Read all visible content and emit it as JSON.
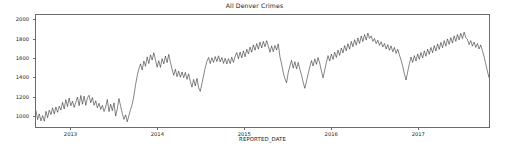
{
  "chart_data": {
    "type": "line",
    "title": "All Denver Crimes",
    "xlabel": "REPORTED_DATE",
    "ylabel": "",
    "grid": false,
    "legend": false,
    "line_color": "#1f1f1f",
    "axis_color": "#6b6b6b",
    "background": "#ffffff",
    "xlim": [
      "2012-08-05",
      "2017-10-29"
    ],
    "ylim": [
      880,
      2060
    ],
    "ytick_values": [
      1000,
      1200,
      1400,
      1600,
      1800,
      2000
    ],
    "ytick_labels": [
      "1000",
      "1200",
      "1400",
      "1600",
      "1800",
      "2000"
    ],
    "xtick_values": [
      "2013-01-01",
      "2014-01-01",
      "2015-01-01",
      "2016-01-01",
      "2017-01-01"
    ],
    "xtick_labels": [
      "2013",
      "2014",
      "2015",
      "2016",
      "2017"
    ],
    "series": [
      {
        "name": "All Denver Crimes",
        "x_start": "2012-08-05",
        "x_step_days": 7,
        "values": [
          1050,
          958,
          1018,
          944,
          1000,
          940,
          1045,
          978,
          1058,
          1012,
          1082,
          1016,
          1092,
          1035,
          1100,
          1058,
          1140,
          1070,
          1168,
          1096,
          1185,
          1104,
          1152,
          1086,
          1140,
          1196,
          1104,
          1212,
          1120,
          1205,
          1108,
          1188,
          1214,
          1136,
          1190,
          1108,
          1156,
          1082,
          1130,
          1064,
          1108,
          1044,
          1090,
          1170,
          1042,
          1120,
          1052,
          1134,
          995,
          1072,
          1180,
          1098,
          1022,
          960,
          1008,
          935,
          1002,
          1064,
          1120,
          1210,
          1325,
          1420,
          1492,
          1545,
          1480,
          1575,
          1520,
          1618,
          1548,
          1640,
          1585,
          1662,
          1588,
          1510,
          1578,
          1508,
          1600,
          1545,
          1628,
          1558,
          1645,
          1560,
          1490,
          1425,
          1488,
          1410,
          1468,
          1405,
          1460,
          1398,
          1455,
          1382,
          1440,
          1360,
          1300,
          1382,
          1312,
          1392,
          1292,
          1255,
          1340,
          1420,
          1505,
          1572,
          1612,
          1548,
          1610,
          1560,
          1622,
          1570,
          1630,
          1566,
          1612,
          1550,
          1605,
          1545,
          1600,
          1548,
          1615,
          1560,
          1625,
          1665,
          1598,
          1670,
          1608,
          1682,
          1620,
          1700,
          1650,
          1722,
          1668,
          1745,
          1688,
          1760,
          1700,
          1775,
          1712,
          1782,
          1725,
          1790,
          1730,
          1668,
          1735,
          1672,
          1740,
          1690,
          1755,
          1620,
          1545,
          1455,
          1390,
          1345,
          1452,
          1520,
          1582,
          1500,
          1568,
          1492,
          1560,
          1488,
          1430,
          1352,
          1288,
          1360,
          1440,
          1512,
          1580,
          1522,
          1598,
          1540,
          1612,
          1550,
          1470,
          1398,
          1480,
          1560,
          1632,
          1575,
          1648,
          1592,
          1668,
          1612,
          1690,
          1635,
          1712,
          1660,
          1738,
          1682,
          1758,
          1700,
          1782,
          1725,
          1800,
          1742,
          1818,
          1760,
          1838,
          1780,
          1855,
          1795,
          1870,
          1812,
          1840,
          1782,
          1812,
          1758,
          1795,
          1740,
          1778,
          1722,
          1760,
          1702,
          1748,
          1688,
          1735,
          1672,
          1718,
          1655,
          1700,
          1640,
          1585,
          1520,
          1442,
          1375,
          1462,
          1545,
          1618,
          1560,
          1632,
          1575,
          1650,
          1592,
          1665,
          1608,
          1682,
          1625,
          1700,
          1645,
          1718,
          1662,
          1738,
          1680,
          1755,
          1698,
          1772,
          1715,
          1790,
          1732,
          1808,
          1750,
          1822,
          1765,
          1840,
          1782,
          1855,
          1798,
          1868,
          1812,
          1880,
          1822,
          1805,
          1748,
          1790,
          1732,
          1775,
          1718,
          1760,
          1702,
          1745,
          1688,
          1625,
          1548,
          1470,
          1402,
          1488,
          1568,
          1642,
          1585,
          1658,
          1600,
          1672,
          1615,
          1690,
          1632,
          1708,
          1650,
          1725,
          1668,
          1745,
          1688,
          1762,
          1705,
          1780,
          1722,
          1798,
          1740,
          1815,
          1758,
          1832,
          1775,
          1850,
          1792,
          1865,
          1808,
          1880,
          1822,
          1895,
          1838,
          1912,
          1855,
          1930,
          1872,
          1948,
          1890,
          1962,
          1905,
          1975,
          1918,
          1990,
          1932,
          1880,
          1795,
          1648,
          1502,
          1380,
          1290
        ]
      }
    ]
  }
}
